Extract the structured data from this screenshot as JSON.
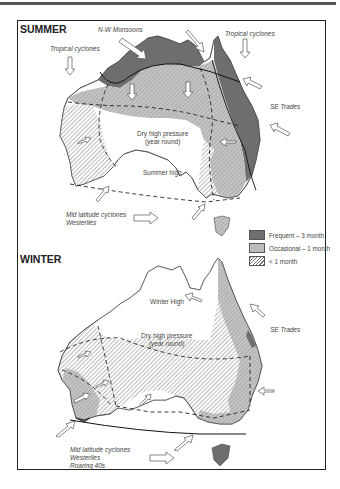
{
  "figure": {
    "summer": {
      "title": "SUMMER",
      "labels": {
        "nw_monsoons": "N-W Monsoons",
        "tropical_cyclones_west": "Tropical cyclones",
        "tropical_cyclones_east": "Tropical cyclones",
        "se_trades": "SE Trades",
        "dry_high_line1": "Dry high pressure",
        "dry_high_line2": "(year round)",
        "summer_high": "Summer high",
        "mid_lat_line1": "Mid latitude cyclones",
        "mid_lat_line2": "Westerlies"
      }
    },
    "winter": {
      "title": "WINTER",
      "labels": {
        "winter_high": "Winter High",
        "se_trades": "SE Trades",
        "dry_high_line1": "Dry high pressure",
        "dry_high_line2": "(year round)",
        "mid_lat_line1": "Mid latitude cyclones",
        "mid_lat_line2": "Westerlies",
        "mid_lat_line3": "Roaring 40s"
      }
    },
    "legend": {
      "items": [
        {
          "key": "frequent",
          "label": "Frequent – 3 month",
          "color": "#6e6e6e"
        },
        {
          "key": "occasional",
          "label": "Occasional – 1 month",
          "color": "#bdbdbd"
        },
        {
          "key": "less",
          "label": "< 1 month",
          "pattern": "hatched"
        }
      ]
    }
  }
}
